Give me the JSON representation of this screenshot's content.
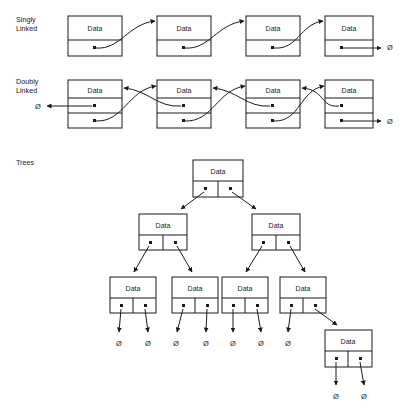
{
  "figure": {
    "background_color": "#ffffff",
    "stroke_color": "#1a1a1a",
    "null_symbol": "Ø",
    "node_label": "Data"
  },
  "sections": [
    {
      "id": "singly-linked",
      "label_line1": "Singly",
      "label_line2": "Linked",
      "label_x": 16,
      "label_y": 22,
      "node_count": 4,
      "rows_per_node": 2,
      "pointer_fields": 1,
      "tail_null": "Ø",
      "nodes": [
        {
          "index": 0,
          "x": 68,
          "y": 16,
          "w": 54,
          "h": 40,
          "data": "Data"
        },
        {
          "index": 1,
          "x": 157,
          "y": 16,
          "w": 54,
          "h": 40,
          "data": "Data"
        },
        {
          "index": 2,
          "x": 246,
          "y": 16,
          "w": 54,
          "h": 40,
          "data": "Data"
        },
        {
          "index": 3,
          "x": 325,
          "y": 16,
          "w": 48,
          "h": 40,
          "data": "Data"
        }
      ],
      "terminator": {
        "label": "Ø",
        "x": 390,
        "y": 46
      }
    },
    {
      "id": "doubly-linked",
      "label_line1": "Doubly",
      "label_line2": "Linked",
      "label_x": 16,
      "label_y": 84,
      "node_count": 4,
      "rows_per_node": 3,
      "pointer_fields": 2,
      "head_null": "Ø",
      "tail_null": "Ø",
      "nodes": [
        {
          "index": 0,
          "x": 68,
          "y": 80,
          "w": 54,
          "h": 48,
          "data": "Data"
        },
        {
          "index": 1,
          "x": 157,
          "y": 80,
          "w": 54,
          "h": 48,
          "data": "Data"
        },
        {
          "index": 2,
          "x": 246,
          "y": 80,
          "w": 54,
          "h": 48,
          "data": "Data"
        },
        {
          "index": 3,
          "x": 325,
          "y": 80,
          "w": 48,
          "h": 48,
          "data": "Data"
        }
      ],
      "head_terminator": {
        "label": "Ø",
        "x": 38,
        "y": 106
      },
      "tail_terminator": {
        "label": "Ø",
        "x": 390,
        "y": 122
      }
    },
    {
      "id": "trees",
      "label_line1": "Trees",
      "label_line2": "",
      "label_x": 16,
      "label_y": 163,
      "levels": [
        {
          "level": 0,
          "nodes": [
            {
              "id": "root",
              "x": 193,
              "y": 160,
              "w": 50,
              "h": 37,
              "data": "Data",
              "left_child": "l1a",
              "right_child": "l1b"
            }
          ]
        },
        {
          "level": 1,
          "nodes": [
            {
              "id": "l1a",
              "x": 139,
              "y": 214,
              "w": 48,
              "h": 36,
              "data": "Data",
              "left_child": "l2a",
              "right_child": "l2b"
            },
            {
              "id": "l1b",
              "x": 252,
              "y": 214,
              "w": 48,
              "h": 36,
              "data": "Data",
              "left_child": "l2c",
              "right_child": "l2d"
            }
          ]
        },
        {
          "level": 2,
          "nodes": [
            {
              "id": "l2a",
              "x": 110,
              "y": 277,
              "w": 46,
              "h": 36,
              "data": "Data",
              "left_child": null,
              "right_child": null
            },
            {
              "id": "l2b",
              "x": 172,
              "y": 277,
              "w": 46,
              "h": 36,
              "data": "Data",
              "left_child": null,
              "right_child": null
            },
            {
              "id": "l2c",
              "x": 222,
              "y": 277,
              "w": 46,
              "h": 36,
              "data": "Data",
              "left_child": null,
              "right_child": null
            },
            {
              "id": "l2d",
              "x": 280,
              "y": 277,
              "w": 46,
              "h": 36,
              "data": "Data",
              "left_child": null,
              "right_child": "l3a"
            }
          ]
        },
        {
          "level": 3,
          "nodes": [
            {
              "id": "l3a",
              "x": 325,
              "y": 330,
              "w": 47,
              "h": 37,
              "data": "Data",
              "left_child": null,
              "right_child": null
            }
          ]
        }
      ],
      "null_leaves": [
        {
          "label": "Ø",
          "x": 119,
          "y": 343
        },
        {
          "label": "Ø",
          "x": 148,
          "y": 343
        },
        {
          "label": "Ø",
          "x": 176,
          "y": 343
        },
        {
          "label": "Ø",
          "x": 206,
          "y": 343
        },
        {
          "label": "Ø",
          "x": 233,
          "y": 343
        },
        {
          "label": "Ø",
          "x": 261,
          "y": 343
        },
        {
          "label": "Ø",
          "x": 288,
          "y": 343
        },
        {
          "label": "Ø",
          "x": 336,
          "y": 396
        },
        {
          "label": "Ø",
          "x": 364,
          "y": 396
        }
      ]
    }
  ]
}
